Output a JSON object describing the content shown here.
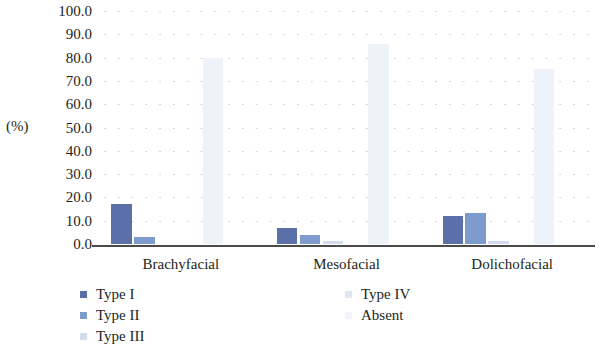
{
  "chart_data": {
    "type": "bar",
    "title": "",
    "xlabel": "",
    "ylabel": "(%)",
    "ylim": [
      0,
      100
    ],
    "ytick_step": 10,
    "grid": "dotted-horizontal",
    "legend_position": "bottom",
    "categories": [
      "Brachyfacial",
      "Mesofacial",
      "Dolichofacial"
    ],
    "ytick_labels": [
      "100.0",
      "90.0",
      "80.0",
      "70.0",
      "60.0",
      "50.0",
      "40.0",
      "30.0",
      "20.0",
      "10.0",
      "0.0"
    ],
    "series": [
      {
        "name": "Type I",
        "color": "#5b6fa8",
        "values": [
          17.0,
          7.0,
          12.0
        ]
      },
      {
        "name": "Type II",
        "color": "#7d9ccd",
        "values": [
          3.0,
          4.0,
          13.5
        ]
      },
      {
        "name": "Type III",
        "color": "#d3dced",
        "values": [
          0.0,
          1.5,
          1.5
        ]
      },
      {
        "name": "Type IV",
        "color": "#dfe7f3",
        "values": [
          0.0,
          0.0,
          0.0
        ]
      },
      {
        "name": "Absent",
        "color": "#eef2f9",
        "values": [
          80.0,
          86.0,
          75.0
        ]
      }
    ]
  },
  "axis": {
    "unit_label": "(%)"
  },
  "legend": {
    "left_column": [
      {
        "label": "Type I",
        "color": "#5b6fa8"
      },
      {
        "label": "Type II",
        "color": "#7d9ccd"
      },
      {
        "label": "Type III",
        "color": "#d3dced"
      }
    ],
    "right_column": [
      {
        "label": "Type IV",
        "color": "#dfe7f3"
      },
      {
        "label": "Absent",
        "color": "#f2f5fa"
      }
    ]
  }
}
